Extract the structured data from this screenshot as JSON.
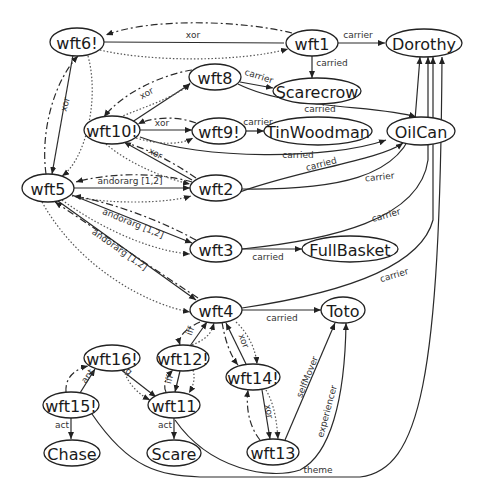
{
  "diagram": {
    "nodes": [
      {
        "id": "wft6",
        "label": "wft6!",
        "x": 77,
        "y": 42,
        "rx": 27,
        "ry": 14,
        "fs": 16
      },
      {
        "id": "wft1",
        "label": "wft1",
        "x": 312,
        "y": 43,
        "rx": 26,
        "ry": 13,
        "fs": 16
      },
      {
        "id": "Dorothy",
        "label": "Dorothy",
        "x": 424,
        "y": 43,
        "rx": 38,
        "ry": 14,
        "fs": 16
      },
      {
        "id": "wft8",
        "label": "wft8",
        "x": 215,
        "y": 77,
        "rx": 26,
        "ry": 13,
        "fs": 16
      },
      {
        "id": "Scarecrow",
        "label": "Scarecrow",
        "x": 317,
        "y": 91,
        "rx": 44,
        "ry": 13,
        "fs": 16
      },
      {
        "id": "wft10",
        "label": "wft10!",
        "x": 112,
        "y": 130,
        "rx": 28,
        "ry": 14,
        "fs": 16
      },
      {
        "id": "wft9",
        "label": "wft9!",
        "x": 219,
        "y": 131,
        "rx": 27,
        "ry": 13,
        "fs": 16
      },
      {
        "id": "TinWoodman",
        "label": "TinWoodman",
        "x": 318,
        "y": 131,
        "rx": 54,
        "ry": 14,
        "fs": 16
      },
      {
        "id": "OilCan",
        "label": "OilCan",
        "x": 421,
        "y": 131,
        "rx": 34,
        "ry": 14,
        "fs": 16
      },
      {
        "id": "wft5",
        "label": "wft5",
        "x": 48,
        "y": 188,
        "rx": 26,
        "ry": 14,
        "fs": 16
      },
      {
        "id": "wft2",
        "label": "wft2",
        "x": 216,
        "y": 188,
        "rx": 26,
        "ry": 13,
        "fs": 16
      },
      {
        "id": "wft3",
        "label": "wft3",
        "x": 216,
        "y": 249,
        "rx": 26,
        "ry": 13,
        "fs": 16
      },
      {
        "id": "FullBasket",
        "label": "FullBasket",
        "x": 350,
        "y": 249,
        "rx": 48,
        "ry": 13,
        "fs": 16
      },
      {
        "id": "wft4",
        "label": "wft4",
        "x": 216,
        "y": 310,
        "rx": 26,
        "ry": 13,
        "fs": 16
      },
      {
        "id": "Toto",
        "label": "Toto",
        "x": 343,
        "y": 310,
        "rx": 22,
        "ry": 13,
        "fs": 16
      },
      {
        "id": "wft16",
        "label": "wft16!",
        "x": 112,
        "y": 358,
        "rx": 28,
        "ry": 13,
        "fs": 16
      },
      {
        "id": "wft12",
        "label": "wft12!",
        "x": 183,
        "y": 358,
        "rx": 26,
        "ry": 13,
        "fs": 16
      },
      {
        "id": "wft14",
        "label": "wft14!",
        "x": 253,
        "y": 377,
        "rx": 27,
        "ry": 13,
        "fs": 16
      },
      {
        "id": "wft15",
        "label": "wft15!",
        "x": 71,
        "y": 405,
        "rx": 28,
        "ry": 13,
        "fs": 16
      },
      {
        "id": "wft11",
        "label": "wft11",
        "x": 174,
        "y": 405,
        "rx": 26,
        "ry": 13,
        "fs": 16
      },
      {
        "id": "wft13",
        "label": "wft13",
        "x": 273,
        "y": 452,
        "rx": 26,
        "ry": 13,
        "fs": 16
      },
      {
        "id": "Chase",
        "label": "Chase",
        "x": 72,
        "y": 453,
        "rx": 28,
        "ry": 13,
        "fs": 16
      },
      {
        "id": "Scare",
        "label": "Scare",
        "x": 174,
        "y": 453,
        "rx": 27,
        "ry": 13,
        "fs": 16
      }
    ],
    "edges": [
      {
        "d": "M104,42 L284,43",
        "style": "solid",
        "label": "xor",
        "lx": 193,
        "ly": 38,
        "rot": 0
      },
      {
        "d": "M292,33 C240,20 150,18 106,35",
        "style": "dashed",
        "label": "",
        "arrow": true
      },
      {
        "d": "M100,50 C150,62 240,62 288,49",
        "style": "dotted",
        "label": "",
        "arrow": true
      },
      {
        "d": "M338,43 L385,43",
        "style": "solid",
        "label": "carrier",
        "lx": 358,
        "ly": 38,
        "rot": 0,
        "arrow": true
      },
      {
        "d": "M312,56 L312,78",
        "style": "solid",
        "label": "carried",
        "lx": 332,
        "ly": 66,
        "rot": 0,
        "arrow": true
      },
      {
        "d": "M240,82 L273,88",
        "style": "solid",
        "label": "carrier",
        "lx": 258,
        "ly": 79,
        "rot": 18,
        "arrow": true
      },
      {
        "d": "M238,84 C290,110 380,105 416,117",
        "style": "solid",
        "label": "carried",
        "lx": 320,
        "ly": 112,
        "rot": 0,
        "arrow": true
      },
      {
        "d": "M246,131 L264,131",
        "style": "solid",
        "label": "carrier",
        "lx": 258,
        "ly": 125,
        "rot": 0,
        "arrow": true
      },
      {
        "d": "M240,192 C300,170 380,160 403,143",
        "style": "solid",
        "label": "carried",
        "lx": 322,
        "ly": 167,
        "rot": -15,
        "arrow": true
      },
      {
        "d": "M140,137 C200,160 330,160 386,140",
        "style": "solid",
        "label": "carried",
        "lx": 298,
        "ly": 158,
        "rot": 0,
        "arrow": true
      },
      {
        "d": "M242,189 C330,190 405,180 415,120 L420,57",
        "style": "solid",
        "label": "carrier",
        "lx": 380,
        "ly": 180,
        "rot": -6,
        "arrow": true
      },
      {
        "d": "M242,249 C330,240 420,220 428,160 L428,57",
        "style": "solid",
        "label": "carrier",
        "lx": 387,
        "ly": 218,
        "rot": -16,
        "arrow": true
      },
      {
        "d": "M242,249 L302,249",
        "style": "solid",
        "label": "carried",
        "lx": 268,
        "ly": 260,
        "rot": 0,
        "arrow": true
      },
      {
        "d": "M242,308 C330,295 420,270 433,220 L433,57",
        "style": "solid",
        "label": "carrier",
        "lx": 395,
        "ly": 278,
        "rot": -17,
        "arrow": true
      },
      {
        "d": "M242,310 L321,310",
        "style": "solid",
        "label": "carried",
        "lx": 282,
        "ly": 321,
        "rot": 0,
        "arrow": true
      },
      {
        "d": "M120,130 L190,84",
        "style": "solid",
        "label": "xor",
        "lx": 148,
        "ly": 96,
        "rot": -30,
        "arrow": true
      },
      {
        "d": "M192,70 C160,75 120,95 104,117",
        "style": "dashed",
        "label": "",
        "arrow": true
      },
      {
        "d": "M120,117 C150,105 180,95 190,83",
        "style": "dotted",
        "label": "",
        "arrow": true
      },
      {
        "d": "M140,130 L192,130",
        "style": "solid",
        "label": "xor",
        "lx": 162,
        "ly": 126,
        "rot": 0,
        "arrow": true
      },
      {
        "d": "M196,123 C175,115 150,118 138,124",
        "style": "dashed",
        "label": "",
        "arrow": true
      },
      {
        "d": "M136,138 C160,145 180,145 193,138",
        "style": "dotted",
        "label": "",
        "arrow": true
      },
      {
        "d": "M192,180 L124,142",
        "style": "solid",
        "label": "xor",
        "lx": 154,
        "ly": 156,
        "rot": 28,
        "arrow": true
      },
      {
        "d": "M196,178 C170,160 145,148 126,143",
        "style": "dashed",
        "label": "",
        "arrow": false
      },
      {
        "d": "M106,144 C130,165 170,180 190,184",
        "style": "dotted",
        "label": "",
        "arrow": true
      },
      {
        "d": "M74,188 L190,188",
        "style": "solid",
        "label": "andorarg [1,2]",
        "lx": 130,
        "ly": 184,
        "rot": 0,
        "arrow": true
      },
      {
        "d": "M192,182 C150,170 100,175 76,182",
        "style": "dashed",
        "label": "",
        "arrow": true
      },
      {
        "d": "M72,196 C110,205 170,203 191,196",
        "style": "dotted",
        "label": "",
        "arrow": true
      },
      {
        "d": "M72,195 L192,243",
        "style": "solid",
        "label": "andorarg [1,2]",
        "lx": 132,
        "ly": 226,
        "rot": 22,
        "arrow": true
      },
      {
        "d": "M196,240 C150,215 100,200 74,196",
        "style": "dashed",
        "label": "",
        "arrow": true
      },
      {
        "d": "M62,200 C110,235 160,252 190,254",
        "style": "dotted",
        "label": "",
        "arrow": true
      },
      {
        "d": "M58,201 L196,300",
        "style": "solid",
        "label": "andorarg [1,2]",
        "lx": 118,
        "ly": 252,
        "rot": 35,
        "arrow": true
      },
      {
        "d": "M198,298 C140,260 90,225 55,202",
        "style": "dashed",
        "label": "",
        "arrow": true
      },
      {
        "d": "M42,202 C80,270 150,305 190,312",
        "style": "dotted",
        "label": "",
        "arrow": true
      },
      {
        "d": "M73,55 L52,174",
        "style": "solid",
        "label": "xor",
        "lx": 68,
        "ly": 105,
        "rot": -75,
        "arrow": true
      },
      {
        "d": "M46,174 C40,130 55,80 78,56",
        "style": "dashed",
        "label": "",
        "arrow": true
      },
      {
        "d": "M88,56 C100,100 85,160 62,176",
        "style": "dotted",
        "label": "",
        "arrow": true
      },
      {
        "d": "M190,346 L207,322",
        "style": "solid",
        "label": "iff",
        "lx": 193,
        "ly": 332,
        "rot": -70,
        "arrow": true
      },
      {
        "d": "M200,322 C183,330 178,338 180,345",
        "style": "dashed",
        "label": "",
        "arrow": true
      },
      {
        "d": "M192,345 C210,338 212,330 214,323",
        "style": "dotted",
        "label": "",
        "arrow": true
      },
      {
        "d": "M180,371 L175,392",
        "style": "solid",
        "label": "iff",
        "lx": 172,
        "ly": 380,
        "rot": -75,
        "arrow": true
      },
      {
        "d": "M166,392 C162,384 168,375 173,370",
        "style": "dashed",
        "label": "",
        "arrow": true
      },
      {
        "d": "M193,370 C196,380 192,388 189,393",
        "style": "dotted",
        "label": "",
        "arrow": true
      },
      {
        "d": "M246,364 L226,323",
        "style": "solid",
        "label": "xor",
        "lx": 241,
        "ly": 342,
        "rot": 70,
        "arrow": true
      },
      {
        "d": "M222,322 C225,340 230,355 238,365",
        "style": "dashed",
        "label": "",
        "arrow": true
      },
      {
        "d": "M236,322 C250,335 256,352 257,364",
        "style": "dotted",
        "label": "",
        "arrow": true
      },
      {
        "d": "M262,390 L270,439",
        "style": "solid",
        "label": "xor",
        "lx": 266,
        "ly": 412,
        "rot": 80,
        "arrow": true
      },
      {
        "d": "M260,440 C248,425 246,405 248,390",
        "style": "dashed",
        "label": "",
        "arrow": true
      },
      {
        "d": "M266,390 C275,405 277,425 278,439",
        "style": "dotted",
        "label": "",
        "arrow": true
      },
      {
        "d": "M285,440 L335,323",
        "style": "solid",
        "label": "selfMover",
        "lx": 310,
        "ly": 378,
        "rot": -68,
        "arrow": true
      },
      {
        "d": "M175,420 C210,470 270,480 300,470 C330,455 345,400 346,323",
        "style": "solid",
        "label": "experiencer",
        "lx": 330,
        "ly": 412,
        "rot": -75,
        "arrow": true
      },
      {
        "d": "M92,414 C130,470 160,475 200,477 L360,477 C420,470 440,380 442,57",
        "style": "solid",
        "label": "theme",
        "lx": 318,
        "ly": 473,
        "rot": 0,
        "arrow": true
      },
      {
        "d": "M97,351 L156,397",
        "style": "solid",
        "label": "cq",
        "lx": 125,
        "ly": 372,
        "rot": 40,
        "arrow": true
      },
      {
        "d": "M124,370 C128,385 140,395 150,400",
        "style": "dotted",
        "label": "",
        "arrow": true
      },
      {
        "d": "M80,393 L95,369",
        "style": "solid",
        "label": "ant",
        "lx": 90,
        "ly": 378,
        "rot": -55,
        "arrow": true
      },
      {
        "d": "M66,392 C65,380 72,370 88,366",
        "style": "dashed",
        "label": "",
        "arrow": true
      },
      {
        "d": "M71,418 L71,439",
        "style": "solid",
        "label": "act",
        "lx": 62,
        "ly": 428,
        "rot": 0,
        "arrow": true
      },
      {
        "d": "M174,418 L174,439",
        "style": "solid",
        "label": "act",
        "lx": 165,
        "ly": 428,
        "rot": 0,
        "arrow": true
      }
    ]
  }
}
